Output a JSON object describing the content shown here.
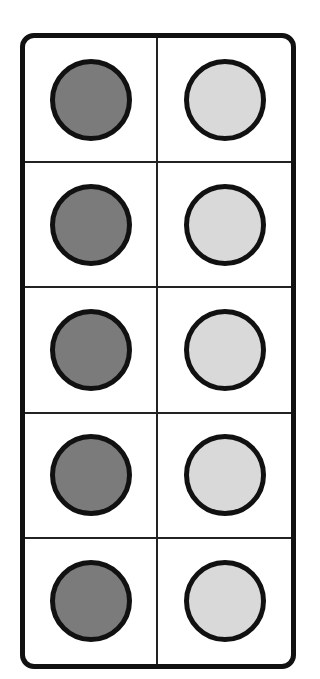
{
  "diagram": {
    "type": "ten-frame",
    "rows": 5,
    "columns": 2,
    "colors": {
      "dark_counter": "#7b7b7b",
      "light_counter": "#d9d9d9",
      "border": "#111111"
    },
    "cells": [
      {
        "row": 1,
        "col": 1,
        "counter": "dark"
      },
      {
        "row": 1,
        "col": 2,
        "counter": "light"
      },
      {
        "row": 2,
        "col": 1,
        "counter": "dark"
      },
      {
        "row": 2,
        "col": 2,
        "counter": "light"
      },
      {
        "row": 3,
        "col": 1,
        "counter": "dark"
      },
      {
        "row": 3,
        "col": 2,
        "counter": "light"
      },
      {
        "row": 4,
        "col": 1,
        "counter": "dark"
      },
      {
        "row": 4,
        "col": 2,
        "counter": "light"
      },
      {
        "row": 5,
        "col": 1,
        "counter": "dark"
      },
      {
        "row": 5,
        "col": 2,
        "counter": "light"
      }
    ],
    "counts": {
      "dark": 5,
      "light": 5,
      "total": 10
    }
  }
}
